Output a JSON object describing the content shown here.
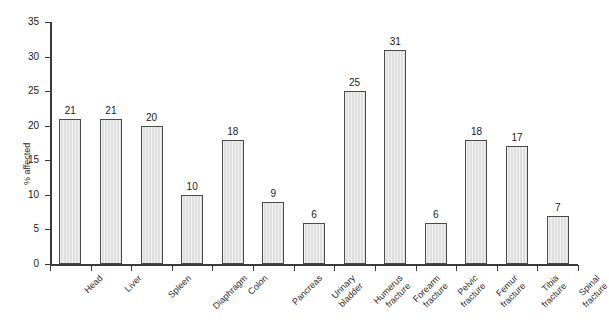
{
  "chart_data": {
    "type": "bar",
    "title": "",
    "xlabel": "",
    "ylabel": "% affected",
    "ylim": [
      0,
      35
    ],
    "ytick_values": [
      0,
      5,
      10,
      15,
      20,
      25,
      30,
      35
    ],
    "ytick_labels": [
      "0",
      "5",
      "10",
      "15",
      "20",
      "25",
      "30",
      "35"
    ],
    "grid": false,
    "legend": "none",
    "value_labels_shown": true,
    "categories": [
      "Head",
      "Liver",
      "Spleen",
      "Diaphragm",
      "Colon",
      "Pancreas",
      "Urinary bladder",
      "Humerus fracture",
      "Forearm fracture",
      "Pelvic fracture",
      "Femur fracture",
      "Tibia fracture",
      "Spinal fracture"
    ],
    "category_lines": [
      [
        "Head"
      ],
      [
        "Liver"
      ],
      [
        "Spleen"
      ],
      [
        "Diaphragm"
      ],
      [
        "Colon"
      ],
      [
        "Pancreas"
      ],
      [
        "Urinary",
        "bladder"
      ],
      [
        "Humerus",
        "fracture"
      ],
      [
        "Forearm",
        "fracture"
      ],
      [
        "Pelvic",
        "fracture"
      ],
      [
        "Femur",
        "fracture"
      ],
      [
        "Tibia",
        "fracture"
      ],
      [
        "Spinal",
        "fracture"
      ]
    ],
    "values": [
      21,
      21,
      20,
      10,
      18,
      9,
      6,
      25,
      31,
      6,
      18,
      17,
      7
    ],
    "value_label_text": [
      "21",
      "21",
      "20",
      "10",
      "18",
      "9",
      "6",
      "25",
      "31",
      "6",
      "18",
      "17",
      "7"
    ],
    "colors": {
      "bar_fill": "#e3e3e3",
      "bar_edge": "#4a4a4a",
      "axis": "#3a3a3a",
      "text": "#1a1a1a",
      "background": "#ffffff"
    }
  }
}
